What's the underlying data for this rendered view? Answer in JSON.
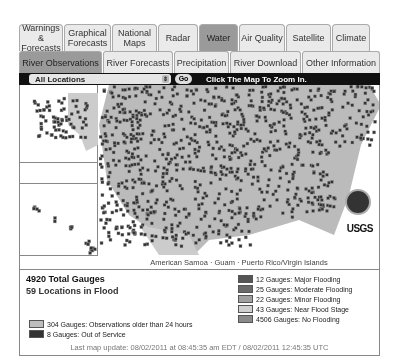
{
  "tabs_primary": [
    {
      "label": "Warnings & Forecasts",
      "active": false,
      "w": 44
    },
    {
      "label": "Graphical Forecasts",
      "active": false,
      "w": 47
    },
    {
      "label": "National Maps",
      "active": false,
      "w": 45
    },
    {
      "label": "Radar",
      "active": false,
      "w": 40
    },
    {
      "label": "Water",
      "active": true,
      "w": 39
    },
    {
      "label": "Air Quality",
      "active": false,
      "w": 46
    },
    {
      "label": "Satellite",
      "active": false,
      "w": 45
    },
    {
      "label": "Climate",
      "active": false,
      "w": 38
    }
  ],
  "tabs_secondary": [
    {
      "label": "River Observations",
      "active": true,
      "w": 83
    },
    {
      "label": "River Forecasts",
      "active": false,
      "w": 70
    },
    {
      "label": "Precipitation",
      "active": false,
      "w": 55
    },
    {
      "label": "River Download",
      "active": false,
      "w": 71
    },
    {
      "label": "Other Information",
      "active": false,
      "w": 78
    }
  ],
  "toolbar": {
    "location_select": "All Locations",
    "go_label": "Go",
    "hint": "Click The Map To Zoom In."
  },
  "map": {
    "territories": "American Samoa  ·  Guam  ·  Puerto Rico/Virgin Islands",
    "logos": [
      "noaa-logo",
      "usgs-logo"
    ],
    "usgs_label": "USGS"
  },
  "legend": {
    "total": "4920 Total Gauges",
    "in_flood": "59 Locations in Flood",
    "left": [
      {
        "label": "304 Gauges: Observations older than 24 hours",
        "color": "#bdbdbd"
      },
      {
        "label": "8 Gauges: Out of Service",
        "color": "#333333"
      }
    ],
    "right": [
      {
        "label": "12 Gauges: Major Flooding",
        "color": "#555555"
      },
      {
        "label": "25 Gauges: Moderate Flooding",
        "color": "#6a6a6a"
      },
      {
        "label": "22 Gauges: Minor Flooding",
        "color": "#a0a0a0"
      },
      {
        "label": "43 Gauges: Near Flood Stage",
        "color": "#cfcfcf"
      },
      {
        "label": "4506 Gauges: No Flooding",
        "color": "#8a8a8a"
      }
    ],
    "updated": "Last map update: 08/02/2011 at 08:45:35 am EDT / 08/02/2011 12:45:35 UTC"
  }
}
